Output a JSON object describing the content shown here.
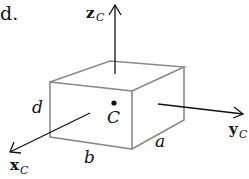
{
  "fragment_text": "d.",
  "labels": {
    "z_axis": "z",
    "z_sub": "C",
    "x_axis": "x",
    "x_sub": "C",
    "y_axis": "y",
    "y_sub": "C",
    "centroid": "C",
    "dim_d": "d",
    "dim_b": "b",
    "dim_a": "a"
  },
  "colors": {
    "box_edges": "#8a8a8a",
    "axes": "#111111",
    "background": "#ffffff"
  }
}
